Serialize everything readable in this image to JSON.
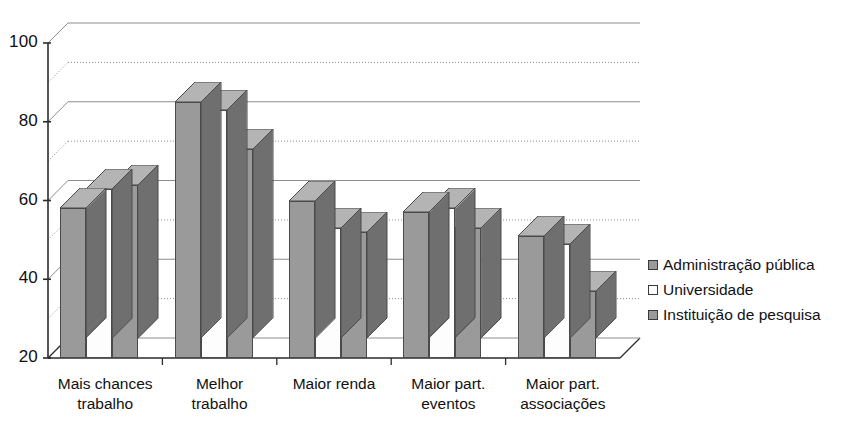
{
  "chart_data": {
    "type": "bar",
    "title": "",
    "subtitle": "",
    "xlabel": "",
    "ylabel": "",
    "categories": [
      "Mais chances trabalho",
      "Melhor trabalho",
      "Maior renda",
      "Maior part. eventos",
      "Maior part. associações"
    ],
    "category_lines": [
      [
        "Mais chances",
        "trabalho"
      ],
      [
        "Melhor",
        "trabalho"
      ],
      [
        "Maior renda",
        ""
      ],
      [
        "Maior part.",
        "eventos"
      ],
      [
        "Maior part.",
        "associações"
      ]
    ],
    "series": [
      {
        "name": "Administração  pública",
        "values": [
          58,
          85,
          60,
          57,
          51
        ]
      },
      {
        "name": "Universidade",
        "values": [
          63,
          83,
          53,
          58,
          49
        ]
      },
      {
        "name": "Instituição de pesquisa",
        "values": [
          64,
          73,
          52,
          53,
          37
        ]
      }
    ],
    "ylim": [
      20,
      100
    ],
    "yticks": [
      20,
      40,
      60,
      80,
      100
    ],
    "ytick_labels": [
      "20",
      "40",
      "60",
      "80",
      "100"
    ],
    "minor_gridlines": [
      30,
      50,
      70,
      90
    ],
    "grid": "major-solid-minor-dotted",
    "legend_position": "right",
    "three_d": true,
    "colors": {
      "series_1_face": "#9a9a9a",
      "series_2_face": "#fdfdfd",
      "series_3_face": "#9a9a9a",
      "top_face": "#b4b4b4",
      "side_face": "#6f6f6f",
      "outline": "#4a4a4a",
      "gridline": "#8d8d8d",
      "axis": "#2b2b2b",
      "background": "#ffffff",
      "text": "#111111"
    }
  }
}
